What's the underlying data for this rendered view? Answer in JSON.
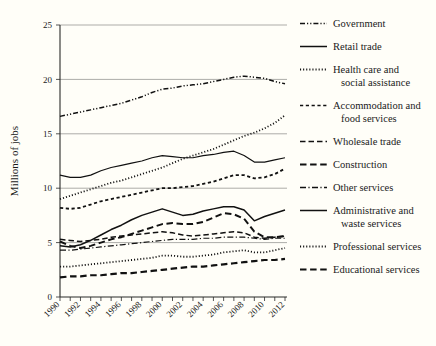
{
  "chart_data": {
    "type": "line",
    "title": "",
    "xlabel": "",
    "ylabel": "Millions of jobs",
    "xlim": [
      1990,
      2012
    ],
    "ylim": [
      0,
      25
    ],
    "yticks": [
      0,
      5,
      10,
      15,
      20,
      25
    ],
    "ytick_labels": [
      "0",
      "5",
      "10",
      "15",
      "20",
      "25"
    ],
    "xticks": [
      1990,
      1991,
      1992,
      1993,
      1994,
      1995,
      1996,
      1997,
      1998,
      1999,
      2000,
      2001,
      2002,
      2003,
      2004,
      2005,
      2006,
      2007,
      2008,
      2009,
      2010,
      2011,
      2012
    ],
    "xtick_labels": [
      "1990",
      "1992",
      "1994",
      "1996",
      "1998",
      "2000",
      "2002",
      "2004",
      "2006",
      "2008",
      "2010",
      "2012"
    ],
    "xtick_label_years": [
      1990,
      1992,
      1994,
      1996,
      1998,
      2000,
      2002,
      2004,
      2006,
      2008,
      2010,
      2012
    ],
    "grid": true,
    "grid_axis": "y",
    "legend_position": "right",
    "x": [
      1990,
      1991,
      1992,
      1993,
      1994,
      1995,
      1996,
      1997,
      1998,
      1999,
      2000,
      2001,
      2002,
      2003,
      2004,
      2005,
      2006,
      2007,
      2008,
      2009,
      2010,
      2011,
      2012
    ],
    "series": [
      {
        "name": "Government",
        "style": "dashdotdot",
        "width": 1.5,
        "values": [
          16.6,
          16.8,
          17.0,
          17.2,
          17.4,
          17.6,
          17.8,
          18.1,
          18.4,
          18.8,
          19.1,
          19.2,
          19.4,
          19.5,
          19.6,
          19.8,
          20.0,
          20.2,
          20.3,
          20.2,
          20.1,
          19.8,
          19.6
        ]
      },
      {
        "name": "Retail trade",
        "style": "solid",
        "width": 1.2,
        "values": [
          11.2,
          11.0,
          11.0,
          11.2,
          11.6,
          11.9,
          12.1,
          12.3,
          12.5,
          12.8,
          13.0,
          12.9,
          12.8,
          12.8,
          13.0,
          13.1,
          13.3,
          13.4,
          13.0,
          12.4,
          12.4,
          12.6,
          12.8
        ]
      },
      {
        "name": "Health care and social assistance",
        "style": "dotted",
        "width": 1.8,
        "values": [
          9.0,
          9.3,
          9.6,
          9.9,
          10.2,
          10.5,
          10.7,
          11.0,
          11.3,
          11.6,
          11.9,
          12.3,
          12.7,
          13.0,
          13.3,
          13.6,
          14.0,
          14.4,
          14.8,
          15.1,
          15.5,
          16.0,
          16.7
        ]
      },
      {
        "name": "Accommodation and food services",
        "style": "dashed-med",
        "width": 1.8,
        "values": [
          8.2,
          8.1,
          8.2,
          8.5,
          8.8,
          9.0,
          9.2,
          9.4,
          9.6,
          9.8,
          10.0,
          10.0,
          10.1,
          10.2,
          10.4,
          10.6,
          10.9,
          11.2,
          11.2,
          10.9,
          11.0,
          11.3,
          11.8
        ]
      },
      {
        "name": "Wholesale trade",
        "style": "dashed-long",
        "width": 1.5,
        "values": [
          5.3,
          5.2,
          5.1,
          5.2,
          5.3,
          5.5,
          5.6,
          5.7,
          5.8,
          5.9,
          6.0,
          5.9,
          5.7,
          5.6,
          5.7,
          5.8,
          5.9,
          6.0,
          5.9,
          5.5,
          5.4,
          5.5,
          5.6
        ]
      },
      {
        "name": "Construction",
        "style": "dashed-bold",
        "width": 2.0,
        "values": [
          5.1,
          4.7,
          4.5,
          4.7,
          5.0,
          5.3,
          5.5,
          5.8,
          6.1,
          6.4,
          6.7,
          6.8,
          6.7,
          6.7,
          6.9,
          7.3,
          7.7,
          7.6,
          7.2,
          6.0,
          5.5,
          5.5,
          5.6
        ]
      },
      {
        "name": "Other services",
        "style": "dashdot",
        "width": 1.2,
        "values": [
          4.3,
          4.3,
          4.4,
          4.5,
          4.6,
          4.7,
          4.8,
          4.9,
          5.0,
          5.1,
          5.2,
          5.3,
          5.3,
          5.3,
          5.4,
          5.4,
          5.5,
          5.5,
          5.5,
          5.4,
          5.3,
          5.4,
          5.4
        ]
      },
      {
        "name": "Administrative and waste services",
        "style": "solid",
        "width": 1.5,
        "values": [
          4.7,
          4.6,
          4.8,
          5.2,
          5.7,
          6.2,
          6.6,
          7.1,
          7.5,
          7.8,
          8.1,
          7.8,
          7.5,
          7.6,
          7.9,
          8.1,
          8.3,
          8.3,
          8.0,
          7.0,
          7.4,
          7.7,
          8.0
        ]
      },
      {
        "name": "Professional services",
        "style": "dotted",
        "width": 1.8,
        "values": [
          2.8,
          2.8,
          2.9,
          3.0,
          3.1,
          3.2,
          3.3,
          3.4,
          3.5,
          3.6,
          3.8,
          3.8,
          3.7,
          3.7,
          3.8,
          3.9,
          4.1,
          4.2,
          4.3,
          4.1,
          4.1,
          4.3,
          4.5
        ]
      },
      {
        "name": "Educational services",
        "style": "dashed-bold",
        "width": 2.2,
        "values": [
          1.8,
          1.9,
          1.9,
          2.0,
          2.0,
          2.1,
          2.2,
          2.2,
          2.3,
          2.4,
          2.5,
          2.6,
          2.7,
          2.8,
          2.8,
          2.9,
          3.0,
          3.1,
          3.2,
          3.3,
          3.4,
          3.4,
          3.5
        ]
      }
    ]
  },
  "legend": {
    "items": [
      {
        "label": "Government",
        "style": "dashdotdot"
      },
      {
        "label": "Retail trade",
        "style": "solid"
      },
      {
        "label": "Health care and",
        "label2": "social assistance",
        "style": "dotted"
      },
      {
        "label": "Accommodation and",
        "label2": "food services",
        "style": "dashed-med"
      },
      {
        "label": "Wholesale trade",
        "style": "dashed-long"
      },
      {
        "label": "Construction",
        "style": "dashed-bold"
      },
      {
        "label": "Other services",
        "style": "dashdot"
      },
      {
        "label": "Administrative and",
        "label2": "waste services",
        "style": "solid"
      },
      {
        "label": "Professional services",
        "style": "dotted"
      },
      {
        "label": "Educational services",
        "style": "dashed-bold"
      }
    ]
  },
  "colors": {
    "background": "#fffef8",
    "ink": "#111111",
    "grid": "#8a8a86"
  }
}
